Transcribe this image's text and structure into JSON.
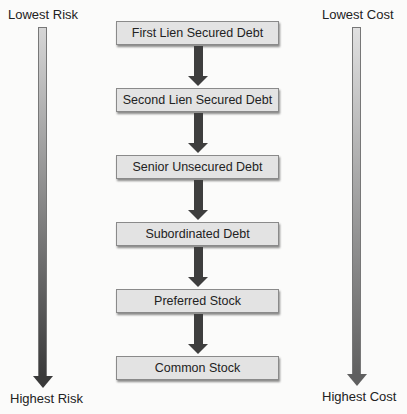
{
  "left_scale": {
    "top_label": "Lowest Risk",
    "bottom_label": "Highest Risk",
    "gradient_top": "#d6d6d6",
    "gradient_bottom": "#3a3a3a"
  },
  "right_scale": {
    "top_label": "Lowest Cost",
    "bottom_label": "Highest Cost",
    "gradient_top": "#e0e0e0",
    "gradient_bottom": "#606060"
  },
  "flow": {
    "steps": [
      {
        "label": "First Lien Secured Debt"
      },
      {
        "label": "Second Lien Secured Debt"
      },
      {
        "label": "Senior Unsecured Debt"
      },
      {
        "label": "Subordinated Debt"
      },
      {
        "label": "Preferred Stock"
      },
      {
        "label": "Common Stock"
      }
    ],
    "box_fill": "#e3e3e3",
    "arrow_color": "#3e3e3e"
  }
}
